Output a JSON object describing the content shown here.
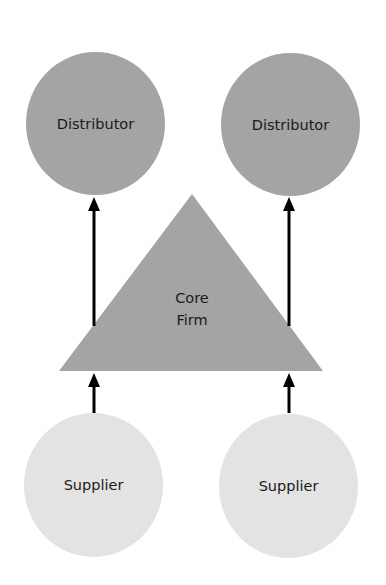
{
  "diagram": {
    "distributors": [
      {
        "label": "Distributor"
      },
      {
        "label": "Distributor"
      }
    ],
    "core": {
      "line1": "Core",
      "line2": "Firm"
    },
    "suppliers": [
      {
        "label": "Supplier"
      },
      {
        "label": "Supplier"
      }
    ],
    "colors": {
      "distributor_fill": "#a4a4a4",
      "core_fill": "#a4a4a4",
      "supplier_fill": "#e3e3e3",
      "arrow": "#000000"
    }
  }
}
